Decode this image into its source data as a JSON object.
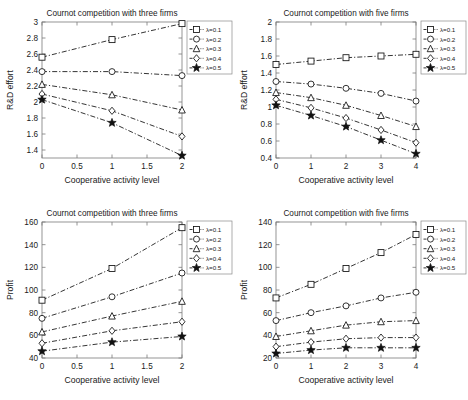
{
  "figure": {
    "background": "#ffffff",
    "line_color": "#111111",
    "axis_color": "#7a7a7a",
    "panel_count": 4
  },
  "legend_entries": [
    {
      "label": "λ=0.1",
      "marker": "square"
    },
    {
      "label": "λ=0.2",
      "marker": "circle"
    },
    {
      "label": "λ=0.3",
      "marker": "triangle"
    },
    {
      "label": "λ=0.4",
      "marker": "diamond"
    },
    {
      "label": "λ=0.5",
      "marker": "star"
    }
  ],
  "chart_data": [
    {
      "id": "top-left",
      "type": "line",
      "title": "Cournot competition with three firms",
      "xlabel": "Cooperative activity level",
      "ylabel": "R&D effort",
      "x": [
        0,
        1,
        2
      ],
      "xlim": [
        0,
        2
      ],
      "xticks": [
        0,
        0.5,
        1,
        1.5,
        2
      ],
      "xticklabels": [
        "0",
        "0.5",
        "1",
        "1.5",
        "2"
      ],
      "ylim": [
        1.3,
        3.0
      ],
      "yticks": [
        1.4,
        1.6,
        1.8,
        2.0,
        2.2,
        2.4,
        2.6,
        2.8,
        3.0
      ],
      "yticklabels": [
        "1.4",
        "1.6",
        "1.8",
        "2",
        "2.2",
        "2.4",
        "2.6",
        "2.8",
        "3"
      ],
      "grid": false,
      "legend_position": "outside-right-top",
      "series": [
        {
          "name": "λ=0.1",
          "marker": "square",
          "values": [
            2.56,
            2.78,
            2.98
          ]
        },
        {
          "name": "λ=0.2",
          "marker": "circle",
          "values": [
            2.38,
            2.38,
            2.33
          ]
        },
        {
          "name": "λ=0.3",
          "marker": "triangle",
          "values": [
            2.22,
            2.09,
            1.9
          ]
        },
        {
          "name": "λ=0.4",
          "marker": "diamond",
          "values": [
            2.1,
            1.89,
            1.57
          ]
        },
        {
          "name": "λ=0.5",
          "marker": "star",
          "values": [
            2.03,
            1.74,
            1.33
          ]
        }
      ]
    },
    {
      "id": "top-right",
      "type": "line",
      "title": "Cournot competition with five firms",
      "xlabel": "Cooperative activity level",
      "ylabel": "R&D effort",
      "x": [
        0,
        1,
        2,
        3,
        4
      ],
      "xlim": [
        0,
        4
      ],
      "xticks": [
        0,
        1,
        2,
        3,
        4
      ],
      "xticklabels": [
        "0",
        "1",
        "2",
        "3",
        "4"
      ],
      "ylim": [
        0.4,
        2.0
      ],
      "yticks": [
        0.4,
        0.6,
        0.8,
        1.0,
        1.2,
        1.4,
        1.6,
        1.8,
        2.0
      ],
      "yticklabels": [
        "0.4",
        "0.6",
        "0.8",
        "1",
        "1.2",
        "1.4",
        "1.6",
        "1.8",
        "2"
      ],
      "grid": false,
      "legend_position": "outside-right-top",
      "series": [
        {
          "name": "λ=0.1",
          "marker": "square",
          "values": [
            1.5,
            1.54,
            1.58,
            1.6,
            1.62
          ]
        },
        {
          "name": "λ=0.2",
          "marker": "circle",
          "values": [
            1.3,
            1.27,
            1.22,
            1.16,
            1.07
          ]
        },
        {
          "name": "λ=0.3",
          "marker": "triangle",
          "values": [
            1.17,
            1.11,
            1.02,
            0.9,
            0.77
          ]
        },
        {
          "name": "λ=0.4",
          "marker": "diamond",
          "values": [
            1.09,
            0.99,
            0.87,
            0.73,
            0.58
          ]
        },
        {
          "name": "λ=0.5",
          "marker": "star",
          "values": [
            1.02,
            0.9,
            0.77,
            0.61,
            0.45
          ]
        }
      ]
    },
    {
      "id": "bottom-left",
      "type": "line",
      "title": "Cournot competition with three firms",
      "xlabel": "Cooperative activity level",
      "ylabel": "Profit",
      "x": [
        0,
        1,
        2
      ],
      "xlim": [
        0,
        2
      ],
      "xticks": [
        0,
        0.5,
        1,
        1.5,
        2
      ],
      "xticklabels": [
        "0",
        "0.5",
        "1",
        "1.5",
        "2"
      ],
      "ylim": [
        40,
        160
      ],
      "yticks": [
        40,
        60,
        80,
        100,
        120,
        140,
        160
      ],
      "yticklabels": [
        "40",
        "60",
        "80",
        "100",
        "120",
        "140",
        "160"
      ],
      "grid": false,
      "legend_position": "outside-right-top",
      "series": [
        {
          "name": "λ=0.1",
          "marker": "square",
          "values": [
            91,
            119,
            155
          ]
        },
        {
          "name": "λ=0.2",
          "marker": "circle",
          "values": [
            75,
            94,
            115
          ]
        },
        {
          "name": "λ=0.3",
          "marker": "triangle",
          "values": [
            63,
            77,
            90
          ]
        },
        {
          "name": "λ=0.4",
          "marker": "diamond",
          "values": [
            53,
            64,
            72
          ]
        },
        {
          "name": "λ=0.5",
          "marker": "star",
          "values": [
            46,
            54,
            59
          ]
        }
      ]
    },
    {
      "id": "bottom-right",
      "type": "line",
      "title": "Cournot competition with five firms",
      "xlabel": "Cooperative activity level",
      "ylabel": "Profit",
      "x": [
        0,
        1,
        2,
        3,
        4
      ],
      "xlim": [
        20,
        140
      ],
      "xticks": [
        0,
        1,
        2,
        3,
        4
      ],
      "xticklabels": [
        "0",
        "1",
        "2",
        "3",
        "4"
      ],
      "ylim": [
        20,
        140
      ],
      "yticks": [
        20,
        40,
        60,
        80,
        100,
        120,
        140
      ],
      "yticklabels": [
        "20",
        "40",
        "60",
        "80",
        "100",
        "120",
        "140"
      ],
      "grid": false,
      "legend_position": "outside-right-top",
      "series": [
        {
          "name": "λ=0.1",
          "marker": "square",
          "values": [
            73,
            85,
            99,
            113,
            129
          ]
        },
        {
          "name": "λ=0.2",
          "marker": "circle",
          "values": [
            53,
            60,
            66,
            73,
            78
          ]
        },
        {
          "name": "λ=0.3",
          "marker": "triangle",
          "values": [
            39,
            44,
            49,
            52,
            53
          ]
        },
        {
          "name": "λ=0.4",
          "marker": "diamond",
          "values": [
            30,
            34,
            37,
            38,
            38
          ]
        },
        {
          "name": "λ=0.5",
          "marker": "star",
          "values": [
            24,
            27,
            29,
            29,
            29
          ]
        }
      ]
    }
  ]
}
